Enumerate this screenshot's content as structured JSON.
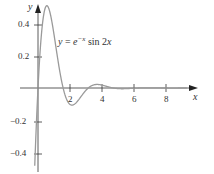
{
  "chart_data": {
    "type": "line",
    "title": "",
    "function_label": "y = e^{-x} sin 2x",
    "xlabel": "x",
    "ylabel": "y",
    "xticks": [
      2,
      4,
      6,
      8
    ],
    "yticks": [
      0.4,
      0.2,
      -0.2,
      -0.4
    ],
    "xlim": [
      -0.3,
      9.5
    ],
    "ylim": [
      -0.5,
      0.52
    ],
    "grid": false,
    "series": [
      {
        "name": "y = e^{-x} sin 2x",
        "color": "#9a9a9a",
        "function": "exp(-x)*sin(2*x)"
      }
    ]
  },
  "labels": {
    "x_axis": "x",
    "y_axis": "y",
    "eq_y": "y",
    "eq_eq": "=",
    "eq_e": "e",
    "eq_exp": "−x",
    "eq_sin": "sin 2",
    "eq_x": "x",
    "xtick_2": "2",
    "xtick_4": "4",
    "xtick_6": "6",
    "xtick_8": "8",
    "ytick_04": "0.4",
    "ytick_02": "0.2",
    "ytick_m02": "−0.2",
    "ytick_m04": "−0.4"
  }
}
